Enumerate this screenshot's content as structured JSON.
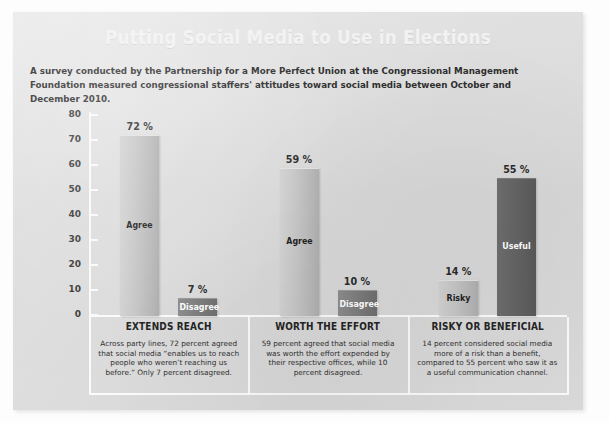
{
  "panel": {
    "title": "Putting Social Media to Use in Elections",
    "subtitle": "A survey conducted by the Partnership for a More Perfect Union at the Congressional Management Foundation measured congressional staffers' attitudes toward social media between October and December 2010."
  },
  "chart_data": {
    "type": "bar",
    "title": "Putting Social Media to Use in Elections",
    "subtitle": "A survey conducted by the Partnership for a More Perfect Union at the Congressional Management Foundation measured congressional staffers' attitudes toward social media between October and December 2010.",
    "xlabel": "",
    "ylabel": "",
    "ylim": [
      0,
      80
    ],
    "yticks": [
      "0",
      "10",
      "20",
      "30",
      "40",
      "50",
      "60",
      "70",
      "80"
    ],
    "grid": false,
    "legend": "none",
    "value_suffix": "%",
    "categories": [
      "EXTENDS REACH",
      "WORTH THE EFFORT",
      "RISKY OR BENEFICIAL"
    ],
    "groups": [
      {
        "category": "EXTENDS REACH",
        "caption": "Across party lines, 72 percent agreed that social media “enables us to reach people who weren’t reaching us before.” Only 7 percent disagreed.",
        "bars": [
          {
            "label": "Agree",
            "value": 72,
            "value_label": "72 %",
            "shade": "light"
          },
          {
            "label": "Disagree",
            "value": 7,
            "value_label": "7 %",
            "shade": "dark"
          }
        ]
      },
      {
        "category": "WORTH THE EFFORT",
        "caption": "59 percent agreed that social media was worth the effort expended by their respective offices, while 10 percent disagreed.",
        "bars": [
          {
            "label": "Agree",
            "value": 59,
            "value_label": "59 %",
            "shade": "light"
          },
          {
            "label": "Disagree",
            "value": 10,
            "value_label": "10 %",
            "shade": "dark"
          }
        ]
      },
      {
        "category": "RISKY OR BENEFICIAL",
        "caption": "14 percent considered social media more of a risk than a benefit, compared to 55 percent who saw it as a useful communication channel.",
        "bars": [
          {
            "label": "Risky",
            "value": 14,
            "value_label": "14 %",
            "shade": "light"
          },
          {
            "label": "Useful",
            "value": 55,
            "value_label": "55 %",
            "shade": "vdark"
          }
        ]
      }
    ],
    "series": [
      {
        "name": "Positive",
        "values": [
          72,
          59,
          55
        ]
      },
      {
        "name": "Negative",
        "values": [
          7,
          10,
          14
        ]
      }
    ],
    "colors": {
      "panel_background": "#dcdcdc",
      "bar_light": "#c6c6c6",
      "bar_dark": "#828282",
      "bar_very_dark": "#666666",
      "axis": "#fafafa",
      "title_text": "#f2f2f2",
      "body_text": "#2e2e2e"
    }
  }
}
